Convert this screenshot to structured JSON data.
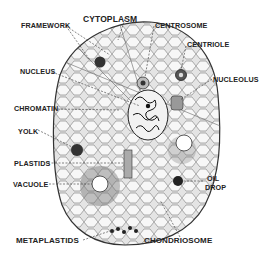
{
  "diagram": {
    "labels": {
      "framework": "FRAMEWORK",
      "cytoplasm": "CYTOPLASM",
      "centrosome": "CENTROSOME",
      "centriole": "CENTRIOLE",
      "nucleus": "NUCLEUS",
      "nucleolus": "NUCLEOLUS",
      "chromatin": "CHROMATIN",
      "yolk": "YOLK",
      "plastids": "PLASTIDS",
      "vacuole": "VACUOLE",
      "oil_drop_line1": "OIL",
      "oil_drop_line2": "DROP",
      "metaplastids": "METAPLASTIDS",
      "chondriosome": "CHONDRIOSOME"
    },
    "colors": {
      "ink": "#222222",
      "cell_fill": "#d9d9d9",
      "mesh": "#8a8a8a",
      "background": "#ffffff"
    }
  }
}
